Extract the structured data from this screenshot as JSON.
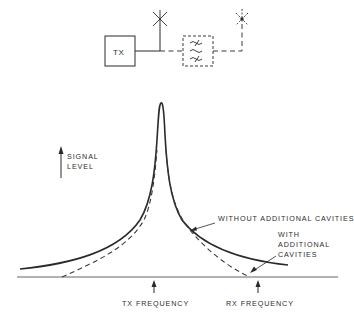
{
  "block_diagram": {
    "transmitter_label": "TX",
    "filter": {
      "type": "cavity-filter",
      "style": "dashed",
      "symbol": "three tilde lines (two struck-through)"
    },
    "antennas": [
      {
        "name": "antenna-without-cavities",
        "style": "solid"
      },
      {
        "name": "antenna-with-cavities",
        "style": "dashed"
      }
    ]
  },
  "plot": {
    "y_axis_label_line1": "SIGNAL",
    "y_axis_label_line2": "LEVEL",
    "x_markers": [
      {
        "label": "TX FREQUENCY"
      },
      {
        "label": "RX FREQUENCY"
      }
    ],
    "curves": [
      {
        "name": "WITHOUT ADDITIONAL CAVITIES",
        "style": "solid"
      },
      {
        "name": "WITH ADDITIONAL CAVITIES",
        "style": "dashed"
      }
    ],
    "annotations": {
      "without": "WITHOUT ADDITIONAL CAVITIES",
      "with_line1": "WITH",
      "with_line2": "ADDITIONAL",
      "with_line3": "CAVITIES"
    }
  },
  "colors": {
    "ink": "#2a2a2a",
    "background": "#ffffff"
  }
}
